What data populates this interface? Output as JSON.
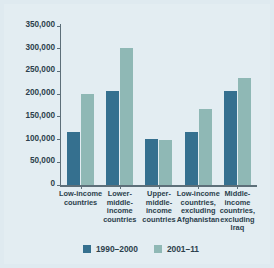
{
  "chart_data": {
    "type": "bar",
    "title": "",
    "xlabel": "",
    "ylabel": "US$ millions (2010 prices)",
    "ylim": [
      0,
      350000
    ],
    "ytick_labels": [
      "350,000",
      "300,000",
      "250,000",
      "200,000",
      "150,000",
      "100,000",
      "50,000",
      "0"
    ],
    "ytick_values": [
      350000,
      300000,
      250000,
      200000,
      150000,
      100000,
      50000,
      0
    ],
    "grid": false,
    "legend_position": "bottom",
    "categories": [
      "Low-income countries",
      "Lower-middle-income countries",
      "Upper-middle-income countries",
      "Low-income countries, excluding Afghanistan",
      "Middle-income countries, excluding Iraq"
    ],
    "category_lines": [
      [
        "Low-income",
        "countries"
      ],
      [
        "Lower-",
        "middle-",
        "income",
        "countries"
      ],
      [
        "Upper-",
        "middle-",
        "income",
        "countries"
      ],
      [
        "Low-income",
        "countries,",
        "excluding",
        "Afghanistan"
      ],
      [
        "Middle-",
        "income",
        "countries,",
        "excluding",
        "Iraq"
      ]
    ],
    "series": [
      {
        "name": "1990–2000",
        "color": "#35708f",
        "values": [
          117000,
          208000,
          102000,
          117000,
          207000
        ]
      },
      {
        "name": "2001–11",
        "color": "#8fb8b5",
        "values": [
          200000,
          302000,
          98000,
          167000,
          235000
        ]
      }
    ]
  },
  "colors": {
    "background": "#e3edf2",
    "axis": "#5d6f79",
    "text": "#2c3f4c",
    "series_1990_2000": "#35708f",
    "series_2001_11": "#8fb8b5"
  }
}
